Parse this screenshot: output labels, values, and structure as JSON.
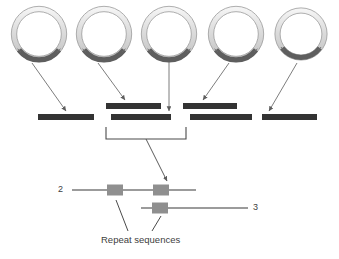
{
  "figure": {
    "type": "biology-schematic",
    "width": 339,
    "height": 259,
    "background": "#ffffff"
  },
  "colors": {
    "ring_outer_stroke": "#8c8c8c",
    "ring_body_light": "#d2d2d2",
    "ring_body_highlight": "#f2f2f2",
    "ring_arc_dark": "#5a5a5a",
    "bar_fill": "#333333",
    "line_gray": "#7a7a7a",
    "repeat_box": "#8f8f8f",
    "arrow_gray": "#6e6e6e",
    "text": "#404040"
  },
  "top_row": {
    "name": "circular-dna-row",
    "count": 5,
    "radius": 25,
    "center_y": 34,
    "items": [
      {
        "id": "circle-1",
        "cx": 39,
        "label": ""
      },
      {
        "id": "circle-2",
        "cx": 104,
        "label": ""
      },
      {
        "id": "circle-3",
        "cx": 169,
        "label": ""
      },
      {
        "id": "circle-4",
        "cx": 236,
        "label": ""
      },
      {
        "id": "circle-5",
        "cx": 301,
        "label": ""
      }
    ]
  },
  "fragment_bars": {
    "name": "fragment-bar-row",
    "count": 6,
    "height": 6,
    "items": [
      {
        "id": "bar-1",
        "x": 38,
        "y": 114,
        "w": 56,
        "row": "lower"
      },
      {
        "id": "bar-2",
        "x": 106,
        "y": 103,
        "w": 55,
        "row": "upper"
      },
      {
        "id": "bar-3",
        "x": 111,
        "y": 114,
        "w": 60,
        "row": "lower"
      },
      {
        "id": "bar-4",
        "x": 183,
        "y": 103,
        "w": 54,
        "row": "upper"
      },
      {
        "id": "bar-5",
        "x": 190,
        "y": 114,
        "w": 62,
        "row": "lower"
      },
      {
        "id": "bar-6",
        "x": 262,
        "y": 114,
        "w": 55,
        "row": "lower"
      }
    ]
  },
  "arrows": {
    "name": "mapping-arrows",
    "items": [
      {
        "id": "arrow-c1-to-bar1",
        "x1": 32,
        "y1": 63,
        "x2": 66,
        "y2": 112
      },
      {
        "id": "arrow-c2-to-bar2",
        "x1": 98,
        "y1": 63,
        "x2": 124,
        "y2": 101
      },
      {
        "id": "arrow-c3-to-bar3",
        "x1": 169,
        "y1": 62,
        "x2": 169,
        "y2": 112
      },
      {
        "id": "arrow-c4-to-bar4",
        "x1": 229,
        "y1": 63,
        "x2": 203,
        "y2": 101
      },
      {
        "id": "arrow-c5-to-bar6",
        "x1": 297,
        "y1": 63,
        "x2": 268,
        "y2": 112
      }
    ]
  },
  "bracket": {
    "name": "consensus-bracket",
    "left_x": 106,
    "right_x": 186,
    "top_y": 127,
    "bottom_y": 139,
    "stem_from": {
      "x": 146,
      "y": 139
    },
    "stem_to": {
      "x": 167,
      "y": 182
    }
  },
  "chromosomes": [
    {
      "id": "chromosome-2",
      "label": "2",
      "label_x": 60,
      "label_y": 186,
      "line_x1": 72,
      "line_x2": 196,
      "line_y": 190,
      "repeats": [
        {
          "id": "repeat-2a",
          "cx": 115,
          "cy": 190,
          "w": 16,
          "h": 11
        },
        {
          "id": "repeat-2b",
          "cx": 161,
          "cy": 190,
          "w": 16,
          "h": 11
        }
      ]
    },
    {
      "id": "chromosome-3",
      "label": "3",
      "label_x": 255,
      "label_y": 204,
      "line_x1": 141,
      "line_x2": 248,
      "line_y": 208,
      "repeats": [
        {
          "id": "repeat-3a",
          "cx": 160,
          "cy": 208,
          "w": 16,
          "h": 11
        }
      ]
    }
  ],
  "caption": {
    "name": "repeat-sequences-caption",
    "text": "Repeat sequences",
    "x": 101,
    "y": 240,
    "leaders": [
      {
        "id": "leader-left",
        "x1": 116,
        "y1": 200,
        "x2": 128,
        "y2": 232
      },
      {
        "id": "leader-right",
        "x1": 161,
        "y1": 216,
        "x2": 153,
        "y2": 232
      }
    ]
  }
}
